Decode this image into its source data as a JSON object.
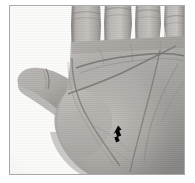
{
  "image": {
    "kind": "photograph",
    "subject": "open human left palm, fingers pointing upward, thumb extended to the left",
    "color_mode": "grayscale",
    "caption": "",
    "width": 195,
    "height": 183
  },
  "frame": {
    "border_color": "#a9a9a9",
    "background_color": "#ffffff"
  },
  "palette": {
    "background": "#ffffff",
    "skin_light": "#c9c6c3",
    "skin_mid": "#a9a6a3",
    "skin_dark": "#7d7a78",
    "skin_shadow": "#5d5a58",
    "crease_line": "#6f6c6a",
    "marker": "#000000"
  },
  "annotations": [
    {
      "name": "arrow-marker",
      "label": "",
      "shape": "solid arrow pointing down-left",
      "color": "#000000",
      "x": 112,
      "y": 129
    }
  ],
  "regions": [
    {
      "name": "index-finger",
      "label": ""
    },
    {
      "name": "middle-finger",
      "label": ""
    },
    {
      "name": "ring-finger",
      "label": ""
    },
    {
      "name": "little-finger",
      "label": ""
    },
    {
      "name": "thumb",
      "label": ""
    },
    {
      "name": "palm",
      "label": ""
    }
  ]
}
